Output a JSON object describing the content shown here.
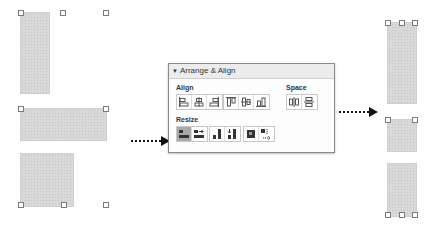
{
  "panel": {
    "title": "Arrange & Align",
    "collapse_glyph": "▼",
    "align_label": "Align",
    "space_label": "Space",
    "resize_label": "Resize",
    "align_buttons": [
      {
        "name": "align-left-icon"
      },
      {
        "name": "align-center-horizontal-icon"
      },
      {
        "name": "align-right-icon"
      },
      {
        "name": "align-top-icon"
      },
      {
        "name": "align-middle-vertical-icon"
      },
      {
        "name": "align-bottom-icon"
      }
    ],
    "space_buttons": [
      {
        "name": "space-horizontal-icon"
      },
      {
        "name": "space-vertical-icon"
      }
    ],
    "resize_buttons": [
      {
        "name": "make-same-width-icon",
        "active": true
      },
      {
        "name": "make-same-width-right-icon",
        "active": false
      },
      {
        "name": "make-same-height-icon",
        "active": false
      },
      {
        "name": "make-same-height-down-icon",
        "active": false
      },
      {
        "name": "make-same-size-icon",
        "active": false
      },
      {
        "name": "make-same-size-down-icon",
        "active": false
      }
    ]
  },
  "colors": {
    "shape_fill": "#d9d9d9",
    "panel_border": "#8a8a8a",
    "active_button": "#a9a9a9",
    "arrow": "#111111"
  }
}
